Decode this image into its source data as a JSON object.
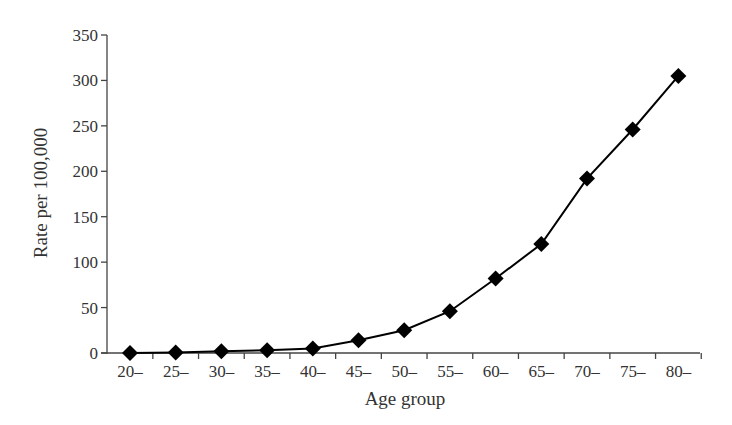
{
  "chart_data": {
    "type": "line",
    "title": "",
    "xlabel": "Age group",
    "ylabel": "Rate per 100,000",
    "categories": [
      "20–",
      "25–",
      "30–",
      "35–",
      "40–",
      "45–",
      "50–",
      "55–",
      "60–",
      "65–",
      "70–",
      "75–",
      "80–"
    ],
    "series": [
      {
        "name": "Rate",
        "marker": "diamond",
        "color": "#000000",
        "values": [
          0,
          0.5,
          2,
          3,
          5,
          14,
          25,
          46,
          82,
          120,
          192,
          246,
          305
        ]
      }
    ],
    "ylim": [
      0,
      350
    ],
    "yticks": [
      0,
      50,
      100,
      150,
      200,
      250,
      300,
      350
    ],
    "grid": false,
    "legend": null
  }
}
